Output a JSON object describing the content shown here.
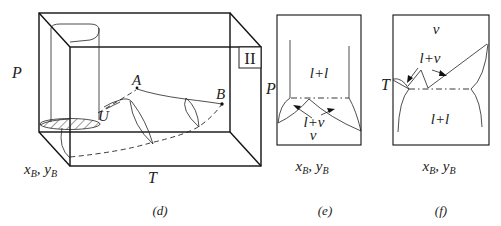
{
  "figure": {
    "panels": [
      {
        "id": "d",
        "caption": "(d)",
        "type": "3D P-T-x phase diagram box",
        "axes": {
          "vertical": "P",
          "horizontal": "T",
          "depth": "x_B, y_B"
        },
        "labels": {
          "region": "II",
          "point_a": "A",
          "point_b": "B",
          "point_u": "U"
        },
        "axis_labels": {
          "p": "P",
          "t": "T",
          "x": "x",
          "x_sub": "B",
          "sep": ", ",
          "y": "y",
          "y_sub": "B"
        }
      },
      {
        "id": "e",
        "caption": "(e)",
        "type": "P-x isothermal section",
        "axes": {
          "vertical": "P",
          "horizontal": "x_B, y_B"
        },
        "regions": {
          "top": "l+l",
          "middle": "l+v",
          "bottom": "v"
        },
        "axis_labels": {
          "p": "P",
          "x": "x",
          "x_sub": "B",
          "sep": ", ",
          "y": "y",
          "y_sub": "B"
        }
      },
      {
        "id": "f",
        "caption": "(f)",
        "type": "T-x isobaric section",
        "axes": {
          "vertical": "T",
          "horizontal": "x_B, y_B"
        },
        "regions": {
          "top": "v",
          "middle": "l+v",
          "bottom": "l+l"
        },
        "axis_labels": {
          "t": "T",
          "x": "x",
          "x_sub": "B",
          "sep": ", ",
          "y": "y",
          "y_sub": "B"
        }
      }
    ]
  }
}
